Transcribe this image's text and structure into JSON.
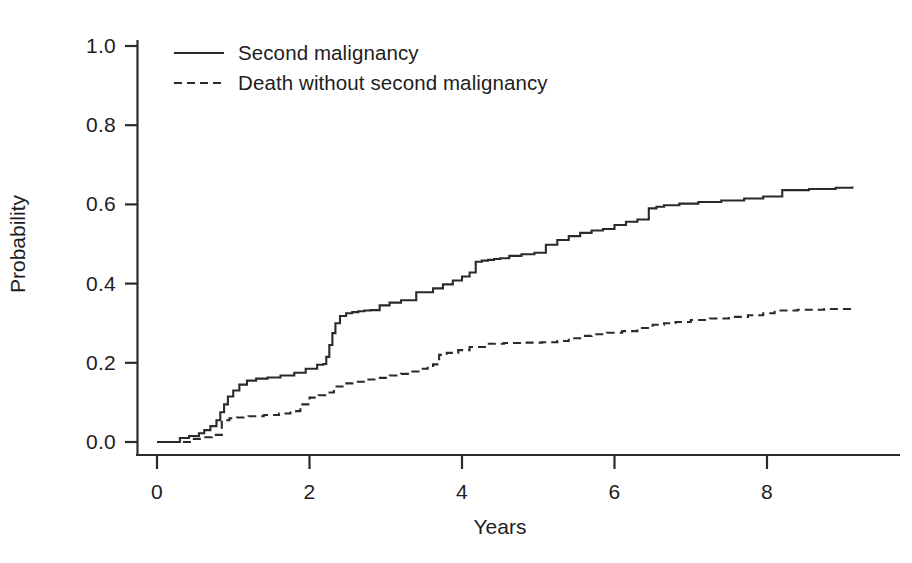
{
  "chart_data": {
    "type": "line",
    "title": "",
    "subtitle": "",
    "xlabel": "Years",
    "ylabel": "Probability",
    "xlim": [
      -0.12,
      9.3
    ],
    "ylim": [
      0.0,
      1.05
    ],
    "xticks": [
      "0",
      "2",
      "4",
      "6",
      "8"
    ],
    "xtick_values": [
      0,
      2,
      4,
      6,
      8
    ],
    "yticks": [
      "0.0",
      "0.2",
      "0.4",
      "0.6",
      "0.8",
      "1.0"
    ],
    "ytick_values": [
      0.0,
      0.2,
      0.4,
      0.6,
      0.8,
      1.0
    ],
    "grid": false,
    "legend_position": "top-left",
    "interpolation": "step-after",
    "annotations": [],
    "series": [
      {
        "name": "Second malignancy",
        "style": "solid",
        "color": "#2a2a2a",
        "final_value": 0.645,
        "x": [
          0.0,
          0.18,
          0.3,
          0.42,
          0.55,
          0.62,
          0.7,
          0.78,
          0.83,
          0.88,
          0.93,
          1.0,
          1.08,
          1.18,
          1.3,
          1.45,
          1.62,
          1.8,
          1.95,
          2.1,
          2.18,
          2.22,
          2.26,
          2.3,
          2.34,
          2.4,
          2.48,
          2.56,
          2.64,
          2.72,
          2.8,
          2.92,
          3.05,
          3.2,
          3.4,
          3.62,
          3.75,
          3.88,
          4.0,
          4.1,
          4.18,
          4.26,
          4.34,
          4.42,
          4.5,
          4.62,
          4.78,
          4.95,
          5.1,
          5.25,
          5.4,
          5.55,
          5.7,
          5.85,
          6.0,
          6.15,
          6.3,
          6.45,
          6.55,
          6.65,
          6.85,
          7.1,
          7.4,
          7.7,
          7.95,
          8.2,
          8.55,
          8.9,
          9.12
        ],
        "y": [
          0.0,
          0.0,
          0.01,
          0.015,
          0.022,
          0.03,
          0.04,
          0.055,
          0.075,
          0.095,
          0.115,
          0.13,
          0.145,
          0.155,
          0.16,
          0.163,
          0.168,
          0.175,
          0.185,
          0.195,
          0.197,
          0.215,
          0.245,
          0.275,
          0.3,
          0.318,
          0.325,
          0.328,
          0.33,
          0.332,
          0.333,
          0.345,
          0.352,
          0.358,
          0.378,
          0.388,
          0.398,
          0.408,
          0.418,
          0.428,
          0.455,
          0.458,
          0.46,
          0.462,
          0.464,
          0.47,
          0.474,
          0.478,
          0.498,
          0.51,
          0.52,
          0.528,
          0.534,
          0.538,
          0.548,
          0.556,
          0.562,
          0.59,
          0.594,
          0.598,
          0.602,
          0.606,
          0.61,
          0.615,
          0.62,
          0.636,
          0.639,
          0.642,
          0.645
        ]
      },
      {
        "name": "Death without second malignancy",
        "style": "dashed",
        "color": "#2a2a2a",
        "final_value": 0.338,
        "x": [
          0.0,
          0.25,
          0.45,
          0.6,
          0.72,
          0.85,
          0.95,
          1.05,
          1.2,
          1.4,
          1.6,
          1.75,
          1.88,
          2.0,
          2.12,
          2.22,
          2.32,
          2.45,
          2.6,
          2.75,
          2.9,
          3.05,
          3.2,
          3.35,
          3.45,
          3.55,
          3.62,
          3.7,
          3.8,
          3.95,
          4.1,
          4.3,
          4.55,
          4.8,
          5.05,
          5.25,
          5.4,
          5.55,
          5.7,
          5.9,
          6.1,
          6.3,
          6.5,
          6.65,
          6.8,
          7.0,
          7.25,
          7.5,
          7.75,
          7.95,
          8.1,
          8.4,
          8.75,
          9.12
        ],
        "y": [
          0.0,
          0.0,
          0.008,
          0.012,
          0.018,
          0.055,
          0.06,
          0.062,
          0.065,
          0.068,
          0.072,
          0.078,
          0.095,
          0.112,
          0.118,
          0.125,
          0.14,
          0.148,
          0.152,
          0.158,
          0.162,
          0.168,
          0.172,
          0.178,
          0.185,
          0.192,
          0.196,
          0.22,
          0.225,
          0.232,
          0.24,
          0.248,
          0.25,
          0.251,
          0.252,
          0.255,
          0.262,
          0.268,
          0.272,
          0.276,
          0.28,
          0.288,
          0.296,
          0.3,
          0.303,
          0.308,
          0.312,
          0.316,
          0.32,
          0.325,
          0.332,
          0.334,
          0.336,
          0.338
        ]
      }
    ]
  },
  "legend": {
    "items": [
      {
        "label": "Second malignancy",
        "style": "solid"
      },
      {
        "label": "Death without second malignancy",
        "style": "dashed"
      }
    ]
  },
  "axes": {
    "x_title": "Years",
    "y_title": "Probability"
  }
}
